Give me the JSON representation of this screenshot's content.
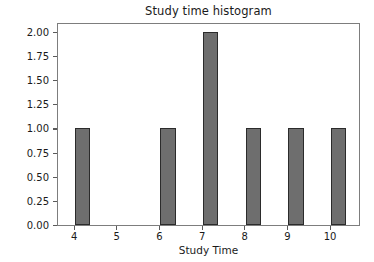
{
  "chart_data": {
    "type": "bar",
    "title": "Study time histogram",
    "xlabel": "Study Time",
    "ylabel": "Frequency",
    "categories": [
      4,
      5,
      6,
      7,
      8,
      9,
      10
    ],
    "values": [
      1,
      0,
      1,
      2,
      1,
      1,
      1
    ],
    "x_tick_labels": [
      "4",
      "5",
      "6",
      "7",
      "8",
      "9",
      "10"
    ],
    "y_tick_labels": [
      "0.00",
      "0.25",
      "0.50",
      "0.75",
      "1.00",
      "1.25",
      "1.50",
      "1.75",
      "2.00"
    ],
    "y_tick_values": [
      0,
      0.25,
      0.5,
      0.75,
      1.0,
      1.25,
      1.5,
      1.75,
      2.0
    ],
    "xlim": [
      3.6,
      10.7
    ],
    "ylim": [
      0,
      2.1
    ],
    "grid": false,
    "legend": false,
    "bar_align": "left-edge-at-category",
    "bar_width_units": 0.36,
    "colors": {
      "bar_fill": "#6e6e6e",
      "bar_edge": "#2b2b2b",
      "axes_frame": "#7d7d7d",
      "text": "#1a1a1a",
      "background": "#ffffff"
    }
  }
}
